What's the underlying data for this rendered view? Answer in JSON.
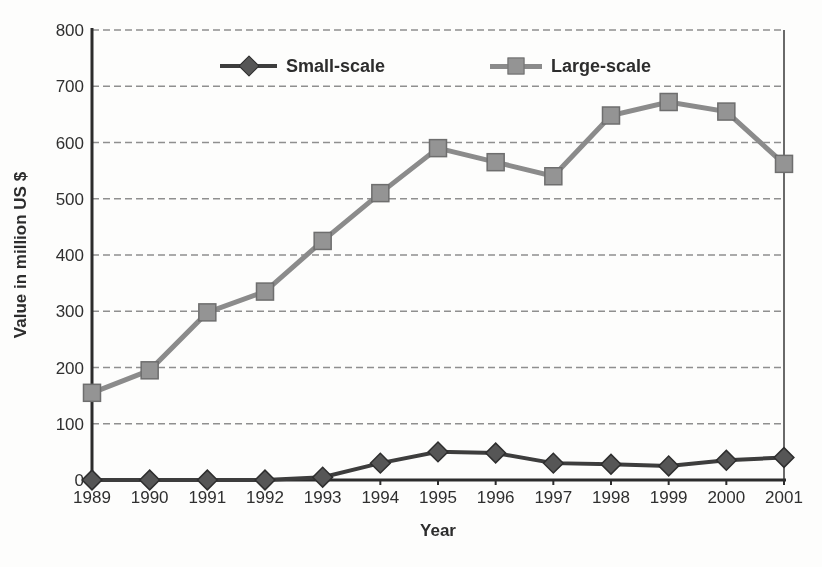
{
  "chart_data": {
    "type": "line",
    "x": [
      1989,
      1990,
      1991,
      1992,
      1993,
      1994,
      1995,
      1996,
      1997,
      1998,
      1999,
      2000,
      2001
    ],
    "xlabel": "Year",
    "ylabel": "Value in million US $",
    "ylim": [
      0,
      800
    ],
    "ytick_step": 100,
    "grid": "horizontal-dashed",
    "legend_position": "top-inside",
    "series": [
      {
        "name": "Small-scale",
        "marker": "diamond",
        "line_color": "#3d3d3d",
        "marker_fill": "#565656",
        "marker_stroke": "#2e2e2e",
        "values": [
          0,
          0,
          0,
          0,
          5,
          30,
          50,
          48,
          30,
          28,
          25,
          35,
          40
        ]
      },
      {
        "name": "Large-scale",
        "marker": "square",
        "line_color": "#8b8b8b",
        "marker_fill": "#949494",
        "marker_stroke": "#6e6e6e",
        "values": [
          155,
          195,
          298,
          335,
          425,
          510,
          590,
          565,
          540,
          648,
          672,
          655,
          562
        ]
      }
    ]
  }
}
